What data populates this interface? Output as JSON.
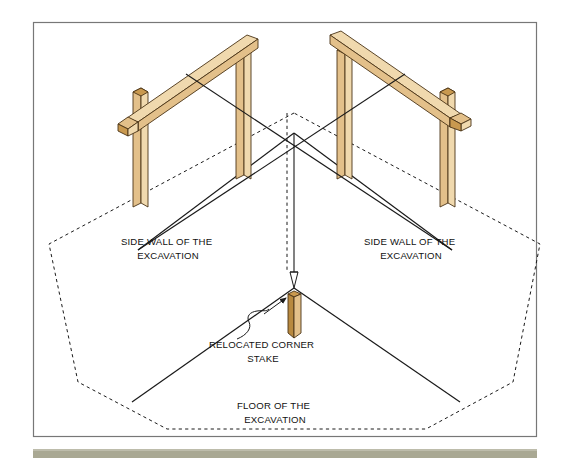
{
  "figure": {
    "type": "isometric-construction-diagram",
    "background_color": "#ffffff",
    "frame": {
      "border_color": "#777777",
      "x": 33,
      "y": 22,
      "width": 504,
      "height": 415
    },
    "footer_bar": {
      "color": "#a9a893",
      "x": 33,
      "y": 449,
      "width": 504,
      "height": 9
    },
    "colors": {
      "wood_face_light": "#f0d9ae",
      "wood_face_mid": "#e3c08a",
      "wood_face_dark": "#c9994f",
      "wood_outline": "#4a3316",
      "line": "#1a1a1a",
      "dashed": "#1a1a1a",
      "text": "#111111",
      "frame": "#777777",
      "footer": "#a9a893"
    },
    "labels": [
      {
        "name": "side-wall-left",
        "lines": [
          "SIDE WALL OF THE",
          "EXCAVATION"
        ],
        "x": 168,
        "y": 245
      },
      {
        "name": "side-wall-right",
        "lines": [
          "SIDE WALL OF THE",
          "EXCAVATION"
        ],
        "x": 411,
        "y": 245
      },
      {
        "name": "relocated-corner-stake",
        "lines": [
          "RELOCATED CORNER",
          "STAKE"
        ],
        "x": 263,
        "y": 341
      },
      {
        "name": "floor-of-excavation",
        "lines": [
          "FLOOR OF THE",
          "EXCAVATION"
        ],
        "x": 275,
        "y": 409
      }
    ],
    "elements": {
      "batter_board_left": "two posts with horizontal ledger board, upper left",
      "batter_board_right": "two posts with horizontal ledger board, upper right",
      "string_lines": "two taut lines crossing at a point above the excavation corner",
      "plumb_line": "vertical line dropping from string intersection to plumb bob",
      "plumb_bob": "pointed weight at lower end of plumb line",
      "corner_stake": "wooden stake driven into the excavation floor below the plumb bob",
      "excavation_outline": "dashed polygon marking the top edge of the excavation",
      "leader_arrow": "squiggle leader with arrowhead pointing at the corner stake"
    }
  }
}
